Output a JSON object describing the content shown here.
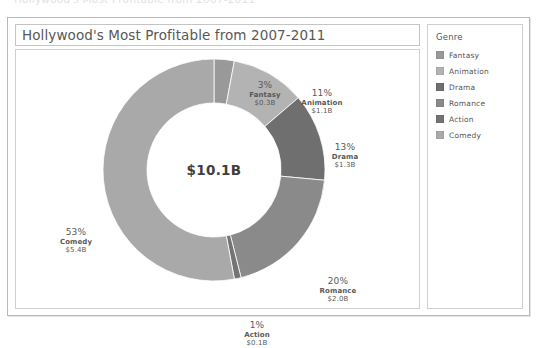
{
  "clipped_header_text": "Hollywood's Most Profitable from 2007-2011",
  "chart": {
    "title": "Hollywood's Most Profitable from 2007-2011",
    "center_total": "$10.1B"
  },
  "legend": {
    "title": "Genre",
    "items": [
      {
        "label": "Fantasy",
        "color": "#999999"
      },
      {
        "label": "Animation",
        "color": "#b3b3b3"
      },
      {
        "label": "Drama",
        "color": "#6f6f6f"
      },
      {
        "label": "Romance",
        "color": "#8a8a8a"
      },
      {
        "label": "Action",
        "color": "#747474"
      },
      {
        "label": "Comedy",
        "color": "#a9a9a9"
      }
    ]
  },
  "labels": {
    "fantasy": {
      "pct": "3%",
      "name": "Fantasy",
      "value": "$0.3B"
    },
    "animation": {
      "pct": "11%",
      "name": "Animation",
      "value": "$1.1B"
    },
    "drama": {
      "pct": "13%",
      "name": "Drama",
      "value": "$1.3B"
    },
    "romance": {
      "pct": "20%",
      "name": "Romance",
      "value": "$2.0B"
    },
    "action": {
      "pct": "1%",
      "name": "Action",
      "value": "$0.1B"
    },
    "comedy": {
      "pct": "53%",
      "name": "Comedy",
      "value": "$5.4B"
    }
  },
  "chart_data": {
    "type": "pie",
    "variant": "donut",
    "title": "Hollywood's Most Profitable from 2007-2011",
    "center_label": "$10.1B",
    "total": 10.1,
    "unit": "B USD",
    "legend_title": "Genre",
    "legend_position": "right",
    "grid": false,
    "categories": [
      "Fantasy",
      "Animation",
      "Drama",
      "Romance",
      "Action",
      "Comedy"
    ],
    "values": [
      0.3,
      1.1,
      1.3,
      2.0,
      0.1,
      5.4
    ],
    "percentages": [
      3,
      11,
      13,
      20,
      1,
      53
    ],
    "value_labels": [
      "$0.3B",
      "$1.1B",
      "$1.3B",
      "$2.0B",
      "$0.1B",
      "$5.4B"
    ],
    "colors": [
      "#999999",
      "#b3b3b3",
      "#6f6f6f",
      "#8a8a8a",
      "#747474",
      "#a9a9a9"
    ],
    "start_angle_deg": 0,
    "direction": "clockwise",
    "xlabel": "",
    "ylabel": ""
  }
}
